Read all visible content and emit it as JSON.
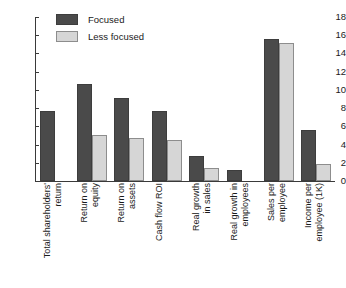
{
  "chart_data": {
    "type": "bar",
    "title": "",
    "subtitle": "",
    "xlabel": "",
    "ylabel": "",
    "ylim": [
      0,
      18
    ],
    "yticks": [
      0,
      2,
      4,
      6,
      8,
      10,
      12,
      14,
      16,
      18
    ],
    "grid": false,
    "legend_position": "top-left",
    "orientation": "vertical",
    "categories": [
      "Total shareholders'\nreturn",
      "Return on\nequity",
      "Return on\nassets",
      "Cash flow ROI",
      "Real growth\nin sales",
      "Real growth in\nemployees",
      "Sales per\nemployee",
      "Income per\nemployee (1K)"
    ],
    "series": [
      {
        "name": "Focused",
        "color": "#4a4a4a",
        "values": [
          7.7,
          10.7,
          9.1,
          7.7,
          2.7,
          1.2,
          15.6,
          5.6
        ]
      },
      {
        "name": "Less focused",
        "color": "#d6d6d6",
        "values": [
          0,
          5.0,
          4.7,
          4.5,
          1.4,
          0,
          15.1,
          1.9
        ]
      }
    ]
  },
  "legend": {
    "items": [
      {
        "label": "Focused",
        "swatch": "focused"
      },
      {
        "label": "Less focused",
        "swatch": "less"
      }
    ]
  }
}
